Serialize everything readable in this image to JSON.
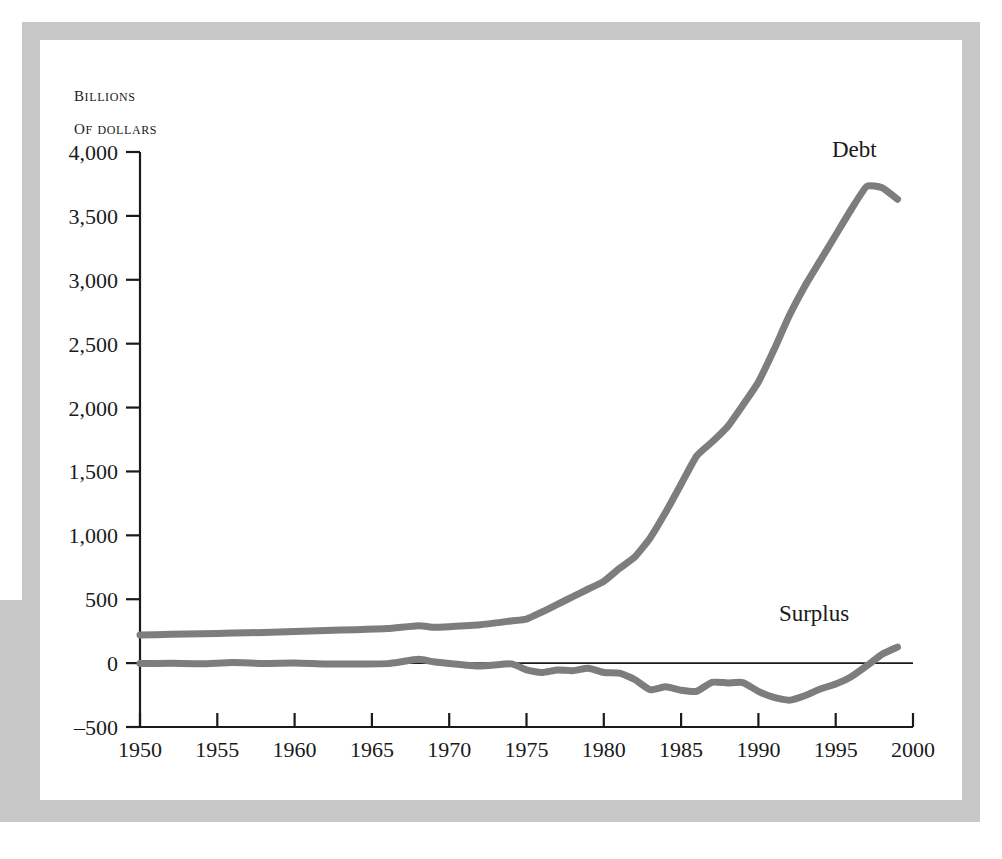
{
  "figure": {
    "background_color": "#ffffff",
    "frame_color": "#c8c8c8",
    "card_color": "#ffffff"
  },
  "axis_caption": {
    "line1": "Billions",
    "line2": "of dollars"
  },
  "chart_data": {
    "type": "line",
    "title": "",
    "subtitle": "",
    "xlabel": "",
    "ylabel": "Billions of dollars",
    "xlim": [
      1950,
      2000
    ],
    "ylim": [
      -500,
      4000
    ],
    "grid": false,
    "legend_position": "inline-annotation",
    "xticks": [
      1950,
      1955,
      1960,
      1965,
      1970,
      1975,
      1980,
      1985,
      1990,
      1995,
      2000
    ],
    "xticklabels": [
      "1950",
      "1955",
      "1960",
      "1965",
      "1970",
      "1975",
      "1980",
      "1985",
      "1990",
      "1995",
      "2000"
    ],
    "yticks": [
      -500,
      0,
      500,
      1000,
      1500,
      2000,
      2500,
      3000,
      3500,
      4000
    ],
    "yticklabels": [
      "–500",
      "0",
      "500",
      "1,000",
      "1,500",
      "2,000",
      "2,500",
      "3,000",
      "3,500",
      "4,000"
    ],
    "zero_line": true,
    "zero_line_color": "#1a1a1a",
    "line_color": "#7d7d7d",
    "line_width": 7,
    "annotations": [
      {
        "text": "Debt",
        "x": 1996.2,
        "y": 3960
      },
      {
        "text": "Surplus",
        "x": 1993.6,
        "y": 330
      }
    ],
    "series": [
      {
        "name": "Debt",
        "label": "Debt",
        "color": "#7d7d7d",
        "x": [
          1950,
          1952,
          1954,
          1956,
          1958,
          1960,
          1962,
          1964,
          1966,
          1968,
          1969,
          1970,
          1972,
          1974,
          1975,
          1976,
          1977,
          1978,
          1979,
          1980,
          1981,
          1982,
          1983,
          1984,
          1985,
          1986,
          1987,
          1988,
          1989,
          1990,
          1991,
          1992,
          1993,
          1994,
          1995,
          1996,
          1997,
          1998,
          1999
        ],
        "values": [
          220,
          225,
          230,
          235,
          240,
          248,
          255,
          262,
          270,
          292,
          280,
          285,
          300,
          330,
          345,
          400,
          460,
          520,
          580,
          640,
          740,
          830,
          980,
          1180,
          1400,
          1620,
          1730,
          1850,
          2020,
          2200,
          2450,
          2720,
          2950,
          3150,
          3350,
          3550,
          3730,
          3720,
          3630
        ]
      },
      {
        "name": "Surplus",
        "label": "Surplus",
        "color": "#7d7d7d",
        "x": [
          1950,
          1952,
          1954,
          1956,
          1958,
          1960,
          1962,
          1964,
          1966,
          1968,
          1969,
          1970,
          1972,
          1974,
          1975,
          1976,
          1977,
          1978,
          1979,
          1980,
          1981,
          1982,
          1983,
          1984,
          1985,
          1986,
          1987,
          1988,
          1989,
          1990,
          1991,
          1992,
          1993,
          1994,
          1995,
          1996,
          1997,
          1998,
          1999
        ],
        "values": [
          -3,
          -2,
          -5,
          4,
          -3,
          0,
          -7,
          -6,
          -4,
          30,
          10,
          -3,
          -23,
          -6,
          -53,
          -74,
          -54,
          -59,
          -40,
          -74,
          -79,
          -128,
          -208,
          -185,
          -212,
          -221,
          -150,
          -155,
          -152,
          -221,
          -269,
          -290,
          -255,
          -203,
          -164,
          -107,
          -22,
          69,
          125
        ]
      }
    ]
  }
}
